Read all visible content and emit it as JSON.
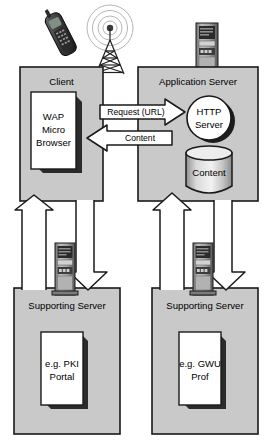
{
  "diagram": {
    "type": "wap-architecture-diagram",
    "colors": {
      "box_fill": "#c9c9c9",
      "box_stroke": "#1a1a1a",
      "doc_fill": "#ffffff",
      "shadow": "#2b2b2b",
      "arrow_fill": "#ffffff",
      "arrow_stroke": "#1a1a1a",
      "tower_dark": "#4a4a4a",
      "tower_mid": "#9a9a9a",
      "text": "#000000"
    },
    "icons": {
      "mobile_phone": "mobile-phone-icon",
      "radio_tower": "radio-tower-icon",
      "server_tower_app": "server-tower-icon",
      "server_tower_left": "server-tower-icon",
      "server_tower_right": "server-tower-icon"
    },
    "nodes": [
      {
        "id": "client",
        "title": "Client",
        "inner_label": "WAP\nMicro\nBrowser",
        "inner_lines": [
          "WAP",
          "Micro",
          "Browser"
        ],
        "shape": "document"
      },
      {
        "id": "application-server",
        "title": "Application Server",
        "children": [
          {
            "id": "http-server",
            "lines": [
              "HTTP",
              "Server"
            ],
            "shape": "circle"
          },
          {
            "id": "content-store",
            "lines": [
              "Content"
            ],
            "shape": "cylinder"
          }
        ]
      },
      {
        "id": "supporting-server-left",
        "title": "Supporting Server",
        "inner_lines": [
          "e.g. PKI",
          "Portal"
        ],
        "shape": "document"
      },
      {
        "id": "supporting-server-right",
        "title": "Supporting Server",
        "inner_lines": [
          "e.g. GWU",
          "Prof"
        ],
        "shape": "document"
      }
    ],
    "connectors": [
      {
        "id": "request-arrow",
        "label": "Request (URL)",
        "direction": "right",
        "from": "client",
        "to": "application-server"
      },
      {
        "id": "content-arrow",
        "label": "Content",
        "direction": "left",
        "from": "application-server",
        "to": "client"
      },
      {
        "id": "client-up-arrow",
        "label": "",
        "direction": "up",
        "from": "supporting-server-left",
        "to": "client"
      },
      {
        "id": "client-down-arrow",
        "label": "",
        "direction": "down",
        "from": "client",
        "to": "supporting-server-left"
      },
      {
        "id": "appserver-up-arrow",
        "label": "",
        "direction": "up",
        "from": "supporting-server-right",
        "to": "application-server"
      },
      {
        "id": "appserver-down-arrow",
        "label": "",
        "direction": "down",
        "from": "application-server",
        "to": "supporting-server-right"
      }
    ]
  }
}
